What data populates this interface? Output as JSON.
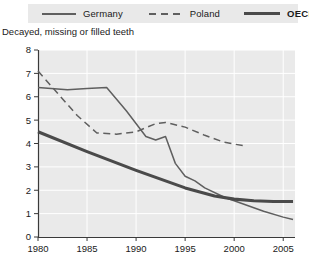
{
  "legend": {
    "items": [
      {
        "label": "Germany",
        "style": "solid-thin",
        "color": "#5f5f5f",
        "icon": "line-swatch-icon"
      },
      {
        "label": "Poland",
        "style": "dashed",
        "color": "#5f5f5f",
        "icon": "dashed-line-swatch-icon"
      },
      {
        "label": "OECD",
        "style": "solid-thick",
        "color": "#4a4a4a",
        "icon": "thick-line-swatch-icon"
      }
    ]
  },
  "subtitle": "Decayed, missing or filled teeth",
  "colors": {
    "plot_background": "#eaeaea",
    "gridline": "#ffffff",
    "axis": "#3a3a3a",
    "germany": "#5f5f5f",
    "poland": "#5f5f5f",
    "oecd": "#4a4a4a",
    "legend_background": "#e9e9e9",
    "text": "#1a1a1a"
  },
  "chart_data": {
    "type": "line",
    "title": "",
    "subtitle": "Decayed, missing or filled teeth",
    "xlabel": "",
    "ylabel": "",
    "xlim": [
      1980,
      2006.2
    ],
    "ylim": [
      0,
      8
    ],
    "xticks": [
      1980,
      1985,
      1990,
      1995,
      2000,
      2005
    ],
    "yticks": [
      0,
      1,
      2,
      3,
      4,
      5,
      6,
      7,
      8
    ],
    "grid": true,
    "legend_position": "top",
    "series": [
      {
        "name": "Germany",
        "style": "solid-thin",
        "color": "#5f5f5f",
        "points": [
          [
            1980,
            6.4
          ],
          [
            1983,
            6.3
          ],
          [
            1985,
            6.35
          ],
          [
            1987,
            6.4
          ],
          [
            1989,
            5.4
          ],
          [
            1991,
            4.3
          ],
          [
            1992,
            4.15
          ],
          [
            1993,
            4.3
          ],
          [
            1994,
            3.15
          ],
          [
            1995,
            2.6
          ],
          [
            1996,
            2.4
          ],
          [
            1997,
            2.1
          ],
          [
            1999,
            1.7
          ],
          [
            2001,
            1.4
          ],
          [
            2003,
            1.1
          ],
          [
            2005,
            0.85
          ],
          [
            2006,
            0.75
          ]
        ]
      },
      {
        "name": "Poland",
        "style": "dashed",
        "color": "#5f5f5f",
        "points": [
          [
            1980,
            7.1
          ],
          [
            1982,
            6.15
          ],
          [
            1984,
            5.2
          ],
          [
            1986,
            4.45
          ],
          [
            1988,
            4.4
          ],
          [
            1990,
            4.5
          ],
          [
            1992,
            4.85
          ],
          [
            1993,
            4.9
          ],
          [
            1995,
            4.7
          ],
          [
            1997,
            4.35
          ],
          [
            1999,
            4.05
          ],
          [
            2001,
            3.9
          ]
        ]
      },
      {
        "name": "OECD",
        "style": "solid-thick",
        "color": "#4a4a4a",
        "points": [
          [
            1980,
            4.5
          ],
          [
            1985,
            3.65
          ],
          [
            1990,
            2.85
          ],
          [
            1995,
            2.1
          ],
          [
            1998,
            1.75
          ],
          [
            2000,
            1.62
          ],
          [
            2002,
            1.55
          ],
          [
            2004,
            1.52
          ],
          [
            2006,
            1.52
          ]
        ]
      }
    ]
  }
}
